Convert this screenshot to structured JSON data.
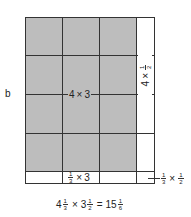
{
  "figure": {
    "panel_label": "b",
    "center_label": {
      "whole_a": "4",
      "op": "×",
      "whole_b": "3"
    },
    "right_column_label": {
      "whole": "4",
      "op": "×",
      "num": "1",
      "den": "2"
    },
    "bottom_strip_label": {
      "num": "1",
      "den": "3",
      "op": "×",
      "whole": "3"
    },
    "corner_label": {
      "num_a": "1",
      "den_a": "3",
      "op": "×",
      "num_b": "1",
      "den_b": "2"
    },
    "equation": {
      "a_whole": "4",
      "a_num": "1",
      "a_den": "3",
      "op": "×",
      "b_whole": "3",
      "b_num": "1",
      "b_den": "2",
      "eq": "=",
      "r_whole": "15",
      "r_num": "1",
      "r_den": "6"
    },
    "colors": {
      "shaded": "#bdbdbd",
      "line": "#333333"
    }
  }
}
